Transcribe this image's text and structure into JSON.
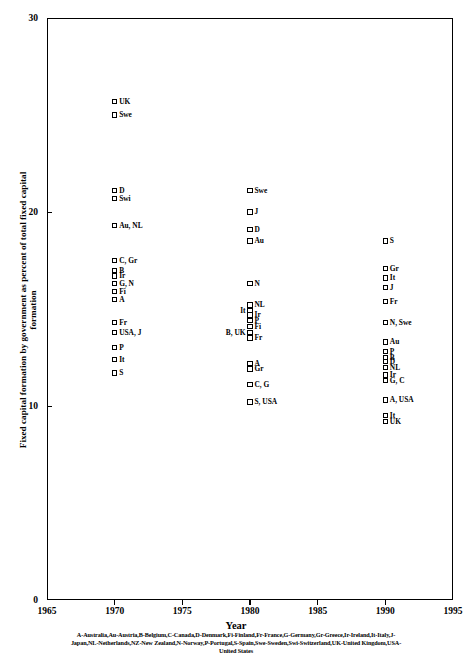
{
  "chart_data": {
    "type": "scatter",
    "title": "",
    "xlabel": "Year",
    "ylabel": "Fixed capital formation by government as percent of total fixed capital formation",
    "xlim": [
      1965,
      1995
    ],
    "ylim": [
      0,
      30
    ],
    "xticks": [
      "1965",
      "1970",
      "1975",
      "1980",
      "1985",
      "1990",
      "1995"
    ],
    "yticks": [
      "0",
      "10",
      "20",
      "30"
    ],
    "grid": false,
    "legend_position": "below-axis-footnote",
    "points": [
      {
        "label": "UK",
        "x": 1970,
        "y": 25.7,
        "side": "right"
      },
      {
        "label": "Swe",
        "x": 1970,
        "y": 25.0,
        "side": "right"
      },
      {
        "label": "D",
        "x": 1970,
        "y": 21.1,
        "side": "right"
      },
      {
        "label": "Swi",
        "x": 1970,
        "y": 20.7,
        "side": "right"
      },
      {
        "label": "Au, NL",
        "x": 1970,
        "y": 19.3,
        "side": "right"
      },
      {
        "label": "C, Gr",
        "x": 1970,
        "y": 17.5,
        "side": "right"
      },
      {
        "label": "B",
        "x": 1970,
        "y": 17.0,
        "side": "right"
      },
      {
        "label": "Ir",
        "x": 1970,
        "y": 16.7,
        "side": "right"
      },
      {
        "label": "G, N",
        "x": 1970,
        "y": 16.3,
        "side": "right"
      },
      {
        "label": "Fi",
        "x": 1970,
        "y": 15.9,
        "side": "right"
      },
      {
        "label": "A",
        "x": 1970,
        "y": 15.5,
        "side": "right"
      },
      {
        "label": "Fr",
        "x": 1970,
        "y": 14.3,
        "side": "right"
      },
      {
        "label": "USA, J",
        "x": 1970,
        "y": 13.8,
        "side": "right"
      },
      {
        "label": "P",
        "x": 1970,
        "y": 13.0,
        "side": "right"
      },
      {
        "label": "It",
        "x": 1970,
        "y": 12.4,
        "side": "right"
      },
      {
        "label": "S",
        "x": 1970,
        "y": 11.7,
        "side": "right"
      },
      {
        "label": "Swe",
        "x": 1980,
        "y": 21.1,
        "side": "right"
      },
      {
        "label": "J",
        "x": 1980,
        "y": 20.0,
        "side": "right"
      },
      {
        "label": "D",
        "x": 1980,
        "y": 19.1,
        "side": "right"
      },
      {
        "label": "Au",
        "x": 1980,
        "y": 18.5,
        "side": "right"
      },
      {
        "label": "N",
        "x": 1980,
        "y": 16.3,
        "side": "right"
      },
      {
        "label": "NL",
        "x": 1980,
        "y": 15.2,
        "side": "right"
      },
      {
        "label": "It",
        "x": 1980,
        "y": 14.9,
        "side": "left"
      },
      {
        "label": "Ir",
        "x": 1980,
        "y": 14.7,
        "side": "right"
      },
      {
        "label": "P",
        "x": 1980,
        "y": 14.4,
        "side": "right"
      },
      {
        "label": "Fi",
        "x": 1980,
        "y": 14.1,
        "side": "right"
      },
      {
        "label": "B, UK",
        "x": 1980,
        "y": 13.8,
        "side": "left"
      },
      {
        "label": "Fr",
        "x": 1980,
        "y": 13.5,
        "side": "right"
      },
      {
        "label": "A",
        "x": 1980,
        "y": 12.2,
        "side": "right"
      },
      {
        "label": "Gr",
        "x": 1980,
        "y": 11.9,
        "side": "right"
      },
      {
        "label": "C, G",
        "x": 1980,
        "y": 11.1,
        "side": "right"
      },
      {
        "label": "S, USA",
        "x": 1980,
        "y": 10.2,
        "side": "right"
      },
      {
        "label": "S",
        "x": 1990,
        "y": 18.5,
        "side": "right"
      },
      {
        "label": "Gr",
        "x": 1990,
        "y": 17.1,
        "side": "right"
      },
      {
        "label": "It",
        "x": 1990,
        "y": 16.6,
        "side": "right"
      },
      {
        "label": "J",
        "x": 1990,
        "y": 16.1,
        "side": "right"
      },
      {
        "label": "Fr",
        "x": 1990,
        "y": 15.4,
        "side": "right"
      },
      {
        "label": "N, Swe",
        "x": 1990,
        "y": 14.3,
        "side": "right"
      },
      {
        "label": "Au",
        "x": 1990,
        "y": 13.3,
        "side": "right"
      },
      {
        "label": "P",
        "x": 1990,
        "y": 12.8,
        "side": "right"
      },
      {
        "label": "B",
        "x": 1990,
        "y": 12.5,
        "side": "right"
      },
      {
        "label": "D",
        "x": 1990,
        "y": 12.3,
        "side": "right"
      },
      {
        "label": "NL",
        "x": 1990,
        "y": 12.0,
        "side": "right"
      },
      {
        "label": "Ir",
        "x": 1990,
        "y": 11.6,
        "side": "right"
      },
      {
        "label": "G, C",
        "x": 1990,
        "y": 11.3,
        "side": "right"
      },
      {
        "label": "A, USA",
        "x": 1990,
        "y": 10.3,
        "side": "right"
      },
      {
        "label": "It",
        "x": 1990,
        "y": 9.5,
        "side": "right"
      },
      {
        "label": "UK",
        "x": 1990,
        "y": 9.2,
        "side": "right"
      }
    ],
    "country_key": [
      "A-Australia,Au-Austria,B-Belgium,C-Canada,D-Denmark,Fi-Finland,Fr-France,G-Germany,Gr-Greece,Ir-Ireland,It-Italy,J-",
      "Japan,NL-Netherlands,NZ-New Zealand,N-Norway,P-Portugal,S-Spain,Swe-Sweden,Swi-Switzerland,UK-United Kingdom,USA-",
      "United States"
    ]
  }
}
